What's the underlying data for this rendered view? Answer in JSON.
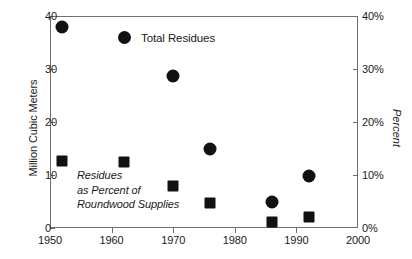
{
  "chart_data": {
    "type": "scatter",
    "title": "",
    "xlabel": "",
    "ylabel": "Million Cubic Meters",
    "y2label": "Percent",
    "xlim": [
      1950,
      2000
    ],
    "ylim": [
      0,
      40
    ],
    "y2lim": [
      0,
      40
    ],
    "grid": false,
    "legend_position": "top-center",
    "xticks": [
      1950,
      1960,
      1970,
      1980,
      1990,
      2000
    ],
    "xticklabels": [
      "1950",
      "1960",
      "1970",
      "1980",
      "1990",
      "2000"
    ],
    "yticks": [
      0,
      10,
      20,
      30,
      40
    ],
    "yticklabels": [
      "0",
      "10",
      "20",
      "30",
      "40"
    ],
    "y2ticks": [
      0,
      10,
      20,
      30,
      40
    ],
    "y2ticklabels": [
      "0%",
      "10%",
      "20%",
      "30%",
      "40%"
    ],
    "series": [
      {
        "name": "Total Residues",
        "marker": "circle",
        "color": "#111111",
        "axis": "left",
        "points": [
          {
            "x": 1952,
            "y": 38.0
          },
          {
            "x": 1970,
            "y": 28.7
          },
          {
            "x": 1976,
            "y": 15.0
          },
          {
            "x": 1986,
            "y": 5.0
          },
          {
            "x": 1992,
            "y": 9.9
          }
        ]
      },
      {
        "name": "Residues as Percent of Roundwood Supplies",
        "marker": "square",
        "color": "#111111",
        "axis": "right",
        "points": [
          {
            "x": 1952,
            "y": 12.6
          },
          {
            "x": 1962,
            "y": 12.4
          },
          {
            "x": 1970,
            "y": 8.0
          },
          {
            "x": 1976,
            "y": 4.7
          },
          {
            "x": 1986,
            "y": 1.1
          },
          {
            "x": 1992,
            "y": 2.0
          }
        ]
      }
    ],
    "annotations": [
      {
        "name": "series-label-percent",
        "lines": [
          "Residues",
          "as Percent of",
          "Roundwood Supplies"
        ],
        "style": "italic"
      }
    ]
  },
  "legend": {
    "entries": [
      {
        "label": "Total Residues",
        "marker": "circle",
        "color": "#111111"
      }
    ]
  },
  "axes": {
    "left_title": "Million Cubic Meters",
    "right_title": "Percent"
  },
  "colors": {
    "marker": "#111111",
    "frame": "#6f6f6f",
    "background": "#ffffff",
    "text": "#1a1a1a"
  }
}
